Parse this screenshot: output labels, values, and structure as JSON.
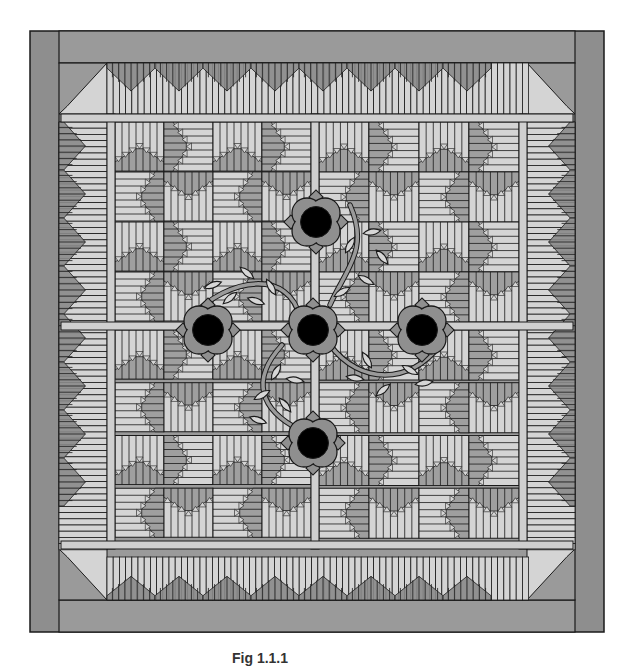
{
  "figure": {
    "caption": "Fig 1.1.1"
  },
  "colors": {
    "outer_border": "#8e8e8e",
    "frame_field": "#9a9a9a",
    "light_fabric": "#d4d4d4",
    "medium_fabric": "#9f9f9f",
    "dark_fabric": "#8a8a8a",
    "sashing": "#cfcfcf",
    "stroke": "#1a1a1a",
    "flower_petal": "#8f8f8f",
    "flower_center": "#000000",
    "leaf": "#d6d6d6",
    "vine": "#9a9a9a"
  },
  "geometry": {
    "outer": {
      "x": 30,
      "y": 31,
      "w": 574,
      "h": 601
    },
    "outer_strip": {
      "left": 29,
      "right": 29,
      "top": 32,
      "bottom": 32
    },
    "field": {
      "x": 59,
      "y": 63,
      "w": 516,
      "h": 537
    },
    "pieced_border": {
      "x0": 59,
      "x1": 575,
      "y0": 63,
      "y1": 600,
      "inner_x0": 107,
      "inner_x1": 527,
      "inner_y0": 114,
      "inner_y1": 549
    },
    "sashing": {
      "width": 8,
      "v": [
        107,
        311,
        519
      ],
      "h": [
        114,
        322,
        541
      ]
    },
    "block_size": 51,
    "quadrant_blocks": 4
  },
  "flowers": [
    {
      "id": "top",
      "cx": 316,
      "cy": 222
    },
    {
      "id": "left",
      "cx": 208,
      "cy": 330
    },
    {
      "id": "center",
      "cx": 313,
      "cy": 330
    },
    {
      "id": "right",
      "cx": 422,
      "cy": 330
    },
    {
      "id": "bottom",
      "cx": 313,
      "cy": 443
    }
  ],
  "vines": [
    {
      "id": "upper-left",
      "d": "M190 318 C 230 275, 290 270, 300 318"
    },
    {
      "id": "upper-right",
      "d": "M330 305 C 345 270, 370 250, 350 205"
    },
    {
      "id": "lower-right",
      "d": "M330 345 C 360 385, 410 385, 440 345"
    },
    {
      "id": "lower-left",
      "d": "M300 430 C 260 410, 250 380, 282 345"
    }
  ],
  "leaves": [
    {
      "x": 213,
      "y": 285,
      "a": -20
    },
    {
      "x": 247,
      "y": 273,
      "a": 40
    },
    {
      "x": 271,
      "y": 287,
      "a": 60
    },
    {
      "x": 230,
      "y": 298,
      "a": -40
    },
    {
      "x": 256,
      "y": 301,
      "a": 20
    },
    {
      "x": 350,
      "y": 245,
      "a": -60
    },
    {
      "x": 372,
      "y": 232,
      "a": -10
    },
    {
      "x": 366,
      "y": 280,
      "a": 30
    },
    {
      "x": 342,
      "y": 292,
      "a": -30
    },
    {
      "x": 382,
      "y": 257,
      "a": 50
    },
    {
      "x": 355,
      "y": 378,
      "a": 10
    },
    {
      "x": 383,
      "y": 390,
      "a": -40
    },
    {
      "x": 410,
      "y": 370,
      "a": 30
    },
    {
      "x": 424,
      "y": 383,
      "a": -10
    },
    {
      "x": 367,
      "y": 360,
      "a": 60
    },
    {
      "x": 262,
      "y": 395,
      "a": -30
    },
    {
      "x": 258,
      "y": 420,
      "a": 20
    },
    {
      "x": 285,
      "y": 405,
      "a": 50
    },
    {
      "x": 276,
      "y": 372,
      "a": -60
    },
    {
      "x": 295,
      "y": 380,
      "a": 10
    }
  ]
}
